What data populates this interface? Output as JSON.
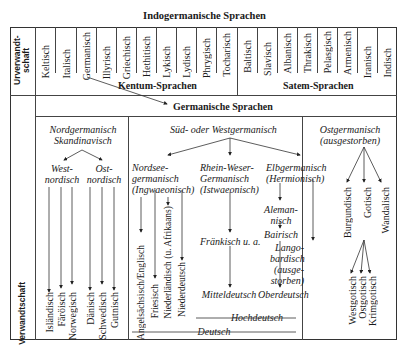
{
  "title": "Indogermanische Sprachen",
  "row_labels": {
    "urverwandtschaft": "Urverwandt-schaft",
    "urverwandtschaft_line1": "Urverwandt-",
    "urverwandtschaft_line2": "schaft",
    "verwandtschaft": "Verwandtschaft"
  },
  "indo_languages": [
    "Keltisch",
    "Italisch",
    "Germanisch",
    "Illyrisch",
    "Griechisch",
    "Hethitisch",
    "Lykisch",
    "Lydisch",
    "Phrygisch",
    "Tocharisch",
    "Baltisch",
    "Slavisch",
    "Albanisch",
    "Thrakisch",
    "Pelasgisch",
    "Armenisch",
    "Iranisch",
    "Indisch"
  ],
  "groups": {
    "kentum": "Kentum-Sprachen",
    "satem": "Satem-Sprachen",
    "germanic": "Germanische Sprachen"
  },
  "north": {
    "title_line1": "Nordgermanisch",
    "title_line2": "Skandinavisch",
    "west_line1": "West-",
    "west_line2": "nordisch",
    "east_line1": "Ost-",
    "east_line2": "nordisch",
    "leaves": [
      "Isländisch",
      "Färöisch",
      "Norwegisch",
      "Dänisch",
      "Schwedisch",
      "Gutnisch"
    ]
  },
  "west": {
    "title": "Süd- oder Westgermanisch",
    "nordsee_line1": "Nordsee-",
    "nordsee_line2": "germanisch",
    "nordsee_line3": "(Ingwaeonisch)",
    "rhein_line1": "Rhein-Weser-",
    "rhein_line2": "Germanisch",
    "rhein_line3": "(Istwaeonisch)",
    "elb_line1": "Elbgermanisch",
    "elb_line2": "(Hermionisch)",
    "nordsee_leaves": [
      "Angelsächsisch/Englisch",
      "Friesisch",
      "Niederländisch (u. Afrikaans)",
      "Niederdeutsch"
    ],
    "fraenkisch": "Fränkisch u. a.",
    "mitteldeutsch": "Mitteldeutsch",
    "alemannisch_line1": "Aleman-",
    "alemannisch_line2": "nisch",
    "bairisch": "Bairisch",
    "oberdeutsch": "Oberdeutsch",
    "lango_line1": "Lango-",
    "lango_line2": "bardisch",
    "lango_line3": "(ausge-",
    "lango_line4": "storben)",
    "hochdeutsch": "Hochdeutsch",
    "deutsch": "Deutsch"
  },
  "east": {
    "title_line1": "Ostgermanisch",
    "title_line2": "(ausgestorben)",
    "leaves": [
      "Burgundisch",
      "Gotisch",
      "Wandalisch"
    ],
    "gotisch_leaves": [
      "Westgotisch",
      "Ostgotisch",
      "Krimgotisch"
    ]
  }
}
